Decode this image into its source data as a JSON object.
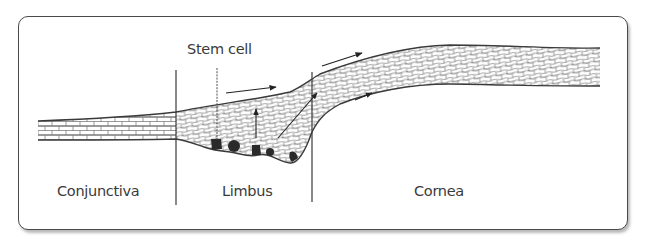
{
  "figure": {
    "labels": {
      "stem_cell": "Stem cell",
      "conjunctiva": "Conjunctiva",
      "limbus": "Limbus",
      "cornea": "Cornea"
    },
    "regions": [
      "Conjunctiva",
      "Limbus",
      "Cornea"
    ],
    "dividers_x": [
      176,
      312
    ],
    "stem_cell_count": 5,
    "colors": {
      "line": "#3a3a3a",
      "cell": "#2a2a2a",
      "frame": "#4a4a4a",
      "background": "#ffffff"
    }
  }
}
